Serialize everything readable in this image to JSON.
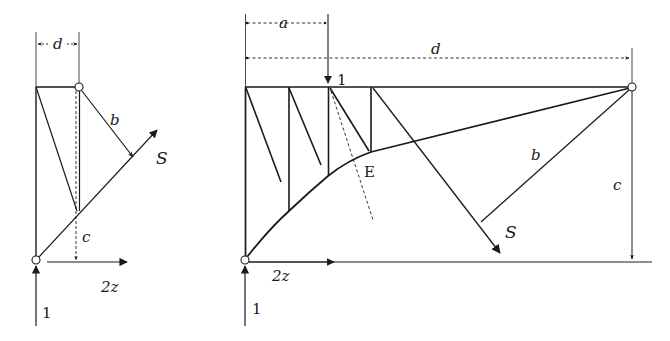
{
  "figure": {
    "type": "structural force diagram",
    "colors": {
      "line": "#1a1a1a",
      "background": "#ffffff"
    }
  },
  "left_diagram": {
    "labels": {
      "d": "d",
      "b": "b",
      "S": "S",
      "c": "c",
      "z": "2z",
      "load": "1"
    }
  },
  "right_diagram": {
    "labels": {
      "a": "a",
      "d": "d",
      "load_top": "1",
      "E": "E",
      "b": "b",
      "c": "c",
      "S": "S",
      "z": "2z",
      "load_bottom": "1"
    }
  }
}
